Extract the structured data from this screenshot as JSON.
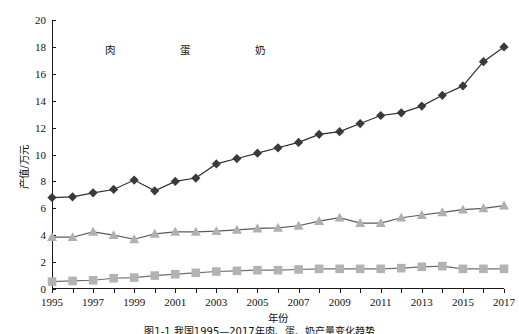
{
  "chart_data": {
    "type": "line",
    "title": "",
    "xlabel": "年份",
    "ylabel": "产值/万元",
    "x": [
      1995,
      1996,
      1997,
      1998,
      1999,
      2000,
      2001,
      2002,
      2003,
      2004,
      2005,
      2006,
      2007,
      2008,
      2009,
      2010,
      2011,
      2012,
      2013,
      2014,
      2015,
      2016,
      2017
    ],
    "xlim": [
      1995,
      2017
    ],
    "ylim": [
      0,
      20
    ],
    "ytick_interval": 2,
    "xtick_labels": [
      "1995",
      "1997",
      "1999",
      "2001",
      "2003",
      "2005",
      "2007",
      "2009",
      "2011",
      "2013",
      "2015",
      "2017"
    ],
    "ytick_labels": [
      "0",
      "2",
      "4",
      "6",
      "8",
      "10",
      "12",
      "14",
      "16",
      "18",
      "20"
    ],
    "grid": false,
    "legend_position": "top-left-inside",
    "series": [
      {
        "name": "肉",
        "marker": "diamond",
        "color": "#3a3a3a",
        "values": [
          6.8,
          6.85,
          7.15,
          7.4,
          8.1,
          7.3,
          8.0,
          8.25,
          9.3,
          9.7,
          10.1,
          10.5,
          10.9,
          11.5,
          11.7,
          12.3,
          12.9,
          13.1,
          13.6,
          14.4,
          15.1,
          16.9,
          18.0
        ]
      },
      {
        "name": "蛋",
        "marker": "square",
        "color": "#b3b3b3",
        "values": [
          0.55,
          0.6,
          0.65,
          0.8,
          0.85,
          1.0,
          1.1,
          1.2,
          1.3,
          1.35,
          1.4,
          1.4,
          1.45,
          1.5,
          1.5,
          1.5,
          1.5,
          1.55,
          1.65,
          1.7,
          1.5,
          1.5,
          1.5
        ]
      },
      {
        "name": "奶",
        "marker": "triangle",
        "color": "#b0b0b0",
        "values": [
          3.85,
          3.85,
          4.25,
          4.0,
          3.7,
          4.1,
          4.25,
          4.25,
          4.3,
          4.4,
          4.5,
          4.55,
          4.7,
          5.05,
          5.3,
          4.9,
          4.9,
          5.3,
          5.5,
          5.7,
          5.9,
          6.0,
          6.2
        ]
      }
    ]
  },
  "caption": "图1-1  我国1995—2017年肉、蛋、奶产量变化趋势"
}
